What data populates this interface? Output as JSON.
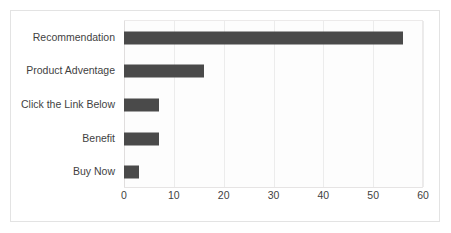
{
  "chart_data": {
    "type": "bar",
    "orientation": "horizontal",
    "title": "",
    "subtitle": "",
    "xlabel": "",
    "ylabel": "",
    "categories": [
      "Recommendation",
      "Product Adventage",
      "Click the Link Below",
      "Benefit",
      "Buy Now"
    ],
    "values": [
      56,
      16,
      7,
      7,
      3
    ],
    "series": [
      {
        "name": "",
        "values": [
          56,
          16,
          7,
          7,
          3
        ]
      }
    ],
    "xlim": [
      0,
      60
    ],
    "ylim": null,
    "xticks": [
      0,
      10,
      20,
      30,
      40,
      50,
      60
    ],
    "xtick_labels": [
      "0",
      "10",
      "20",
      "30",
      "40",
      "50",
      "60"
    ],
    "grid": "vertical",
    "legend": "none",
    "annotations": [],
    "colors": {
      "bar": "#4a4a4a",
      "gridline": "#ececec",
      "axis": "#e0dede",
      "frame": "#e3e3e3",
      "plot_background": "#fdfdfd",
      "figure_background": "#ffffff",
      "tick_text": "#3f3f3f"
    }
  }
}
